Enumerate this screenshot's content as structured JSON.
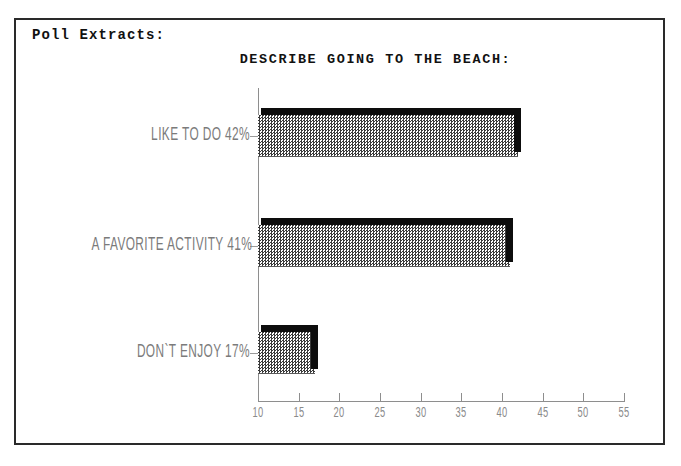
{
  "page": {
    "heading": "Poll Extracts:",
    "background_color": "#ffffff",
    "frame_color": "#2a2a2a"
  },
  "chart_data": {
    "type": "bar",
    "orientation": "horizontal",
    "title": "DESCRIBE GOING TO THE BEACH:",
    "xlabel": "",
    "ylabel": "",
    "categories": [
      "LIKE TO DO",
      "A FAVORITE ACTIVITY",
      "DON`T ENJOY"
    ],
    "bar_labels": [
      "LIKE TO DO 42%",
      "A FAVORITE ACTIVITY 41%",
      "DON`T ENJOY 17%"
    ],
    "values": [
      42,
      41,
      17
    ],
    "value_suffix": "%",
    "xlim": [
      10,
      55
    ],
    "xticks": [
      10,
      15,
      20,
      25,
      30,
      35,
      40,
      45,
      50,
      55
    ],
    "xtick_labels": [
      "10",
      "15",
      "20",
      "25",
      "30",
      "35",
      "40",
      "45",
      "50",
      "55"
    ],
    "grid": false,
    "legend": false,
    "bar_fill": "#c8c8c8",
    "bar_fill_style": "checkerboard-dither",
    "bar_shadow_color": "#0d0d0d",
    "axis_color": "#8e8e8e",
    "label_color": "#7b7b7b"
  }
}
